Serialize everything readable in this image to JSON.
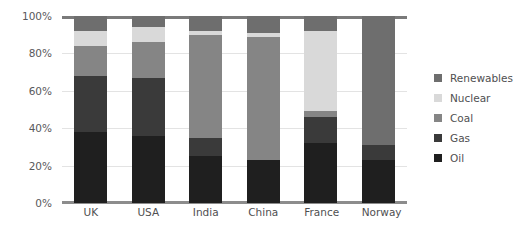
{
  "chart_data": {
    "type": "bar",
    "subtype": "stacked-100-percent",
    "title": "",
    "xlabel": "",
    "ylabel": "",
    "ylim": [
      0,
      100
    ],
    "y_ticks": [
      "0%",
      "20%",
      "40%",
      "60%",
      "80%",
      "100%"
    ],
    "y_tick_values": [
      0,
      20,
      40,
      60,
      80,
      100
    ],
    "grid": true,
    "legend_position": "right",
    "categories": [
      "UK",
      "USA",
      "India",
      "China",
      "France",
      "Norway"
    ],
    "series": [
      {
        "name": "Oil",
        "color": "#1f1f1f",
        "values": [
          38,
          36,
          25,
          23,
          32,
          23
        ]
      },
      {
        "name": "Gas",
        "color": "#3a3a3a",
        "values": [
          30,
          31,
          10,
          0,
          14,
          8
        ]
      },
      {
        "name": "Coal",
        "color": "#858585",
        "values": [
          16,
          19,
          55,
          66,
          3,
          0
        ]
      },
      {
        "name": "Nuclear",
        "color": "#d9d9d9",
        "values": [
          8,
          8,
          2,
          2,
          43,
          0
        ]
      },
      {
        "name": "Renewables",
        "color": "#6e6e6e",
        "values": [
          8,
          6,
          8,
          9,
          8,
          69
        ]
      }
    ],
    "legend_entries": [
      {
        "label": "Renewables",
        "color": "#6e6e6e"
      },
      {
        "label": "Nuclear",
        "color": "#d9d9d9"
      },
      {
        "label": "Coal",
        "color": "#858585"
      },
      {
        "label": "Gas",
        "color": "#3a3a3a"
      },
      {
        "label": "Oil",
        "color": "#1f1f1f"
      }
    ],
    "colors": {
      "background": "#ffffff",
      "gridline": "#e3e3e3",
      "axis": "#8c8c8c",
      "tick_text": "#4f4f51"
    }
  }
}
